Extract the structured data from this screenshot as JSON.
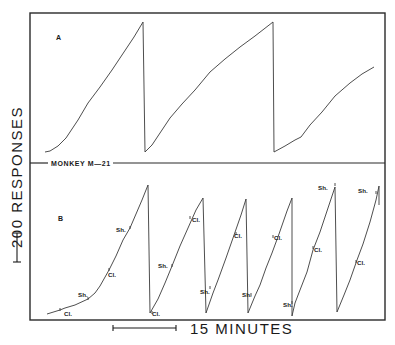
{
  "figure": {
    "ylabel": "200  RESPONSES",
    "xlabel": "15 MINUTES",
    "subject_label": "MONKEY M—21",
    "scalebars": {
      "vertical": {
        "represents": "200 responses"
      },
      "horizontal": {
        "represents": "15 minutes"
      }
    }
  },
  "chart_data": {
    "type": "line",
    "xlabel": "Time (scale bar = 15 minutes)",
    "ylabel": "Cumulative responses (scale bar = 200 responses, pen resets at top)",
    "grid": false,
    "legend": null,
    "panels": [
      {
        "label": "A",
        "description": "Cumulative record with pen resets; 3 excursions",
        "segments": [
          {
            "points": [
              [
                45,
                152
              ],
              [
                50,
                151
              ],
              [
                58,
                146
              ],
              [
                66,
                138
              ],
              [
                70,
                132
              ],
              [
                78,
                120
              ],
              [
                88,
                103
              ],
              [
                100,
                87
              ],
              [
                112,
                70
              ],
              [
                124,
                52
              ],
              [
                134,
                37
              ],
              [
                143,
                22
              ]
            ]
          },
          {
            "reset": [
              [
                143,
                22
              ],
              [
                145,
                152
              ]
            ]
          },
          {
            "points": [
              [
                145,
                152
              ],
              [
                152,
                145
              ],
              [
                160,
                133
              ],
              [
                170,
                118
              ],
              [
                182,
                104
              ],
              [
                195,
                90
              ],
              [
                210,
                72
              ],
              [
                225,
                59
              ],
              [
                240,
                47
              ],
              [
                255,
                36
              ],
              [
                273,
                22
              ]
            ]
          },
          {
            "reset": [
              [
                273,
                22
              ],
              [
                274,
                152
              ]
            ]
          },
          {
            "points": [
              [
                274,
                152
              ],
              [
                285,
                146
              ],
              [
                295,
                140
              ],
              [
                301,
                137
              ],
              [
                310,
                125
              ],
              [
                322,
                112
              ],
              [
                335,
                96
              ],
              [
                350,
                83
              ],
              [
                362,
                74
              ],
              [
                374,
                67
              ]
            ]
          }
        ]
      },
      {
        "label": "B",
        "description": "Cumulative record with Cl. / Sh. event marks; 6 excursions",
        "segments": [
          {
            "points": [
              [
                47,
                314
              ],
              [
                60,
                310
              ],
              [
                65,
                308
              ],
              [
                75,
                305
              ],
              [
                88,
                299
              ],
              [
                95,
                293
              ],
              [
                100,
                286
              ],
              [
                109,
                270
              ],
              [
                116,
                256
              ],
              [
                123,
                240
              ],
              [
                130,
                228
              ],
              [
                142,
                200
              ],
              [
                148,
                185
              ]
            ]
          },
          {
            "reset": [
              [
                148,
                185
              ],
              [
                150,
                313
              ]
            ]
          },
          {
            "points": [
              [
                150,
                313
              ],
              [
                158,
                299
              ],
              [
                165,
                283
              ],
              [
                172,
                266
              ],
              [
                180,
                246
              ],
              [
                188,
                228
              ],
              [
                196,
                210
              ],
              [
                203,
                198
              ]
            ]
          },
          {
            "reset": [
              [
                203,
                198
              ],
              [
                206,
                313
              ]
            ]
          },
          {
            "points": [
              [
                206,
                313
              ],
              [
                213,
                293
              ],
              [
                218,
                280
              ],
              [
                226,
                258
              ],
              [
                233,
                238
              ],
              [
                241,
                215
              ],
              [
                246,
                199
              ]
            ]
          },
          {
            "reset": [
              [
                246,
                199
              ],
              [
                248,
                313
              ]
            ]
          },
          {
            "points": [
              [
                248,
                313
              ],
              [
                255,
                296
              ],
              [
                260,
                285
              ],
              [
                266,
                268
              ],
              [
                272,
                253
              ],
              [
                279,
                234
              ],
              [
                287,
                211
              ],
              [
                292,
                198
              ]
            ]
          },
          {
            "reset": [
              [
                292,
                198
              ],
              [
                292,
                316
              ]
            ]
          },
          {
            "points": [
              [
                292,
                316
              ],
              [
                295,
                303
              ],
              [
                300,
                290
              ],
              [
                307,
                272
              ],
              [
                313,
                250
              ],
              [
                320,
                232
              ],
              [
                329,
                205
              ],
              [
                335,
                187
              ]
            ]
          },
          {
            "reset": [
              [
                335,
                187
              ],
              [
                337,
                312
              ]
            ]
          },
          {
            "points": [
              [
                337,
                312
              ],
              [
                344,
                295
              ],
              [
                350,
                280
              ],
              [
                357,
                260
              ],
              [
                363,
                244
              ],
              [
                370,
                222
              ],
              [
                376,
                200
              ],
              [
                379,
                186
              ]
            ]
          },
          {
            "reset": [
              [
                379,
                186
              ],
              [
                379,
                205
              ]
            ]
          }
        ],
        "event_marks": [
          {
            "text": "Cl.",
            "x": 60,
            "y": 310
          },
          {
            "text": "Sh.",
            "x": 88,
            "y": 299
          },
          {
            "text": "Cl.",
            "x": 109,
            "y": 270
          },
          {
            "text": "Sh.",
            "x": 130,
            "y": 228
          },
          {
            "text": "Cl.",
            "x": 152,
            "y": 313
          },
          {
            "text": "Sh.",
            "x": 172,
            "y": 266
          },
          {
            "text": "Cl.",
            "x": 190,
            "y": 218
          },
          {
            "text": "Sh.",
            "x": 210,
            "y": 288
          },
          {
            "text": "Cl.",
            "x": 236,
            "y": 234
          },
          {
            "text": "Sh.",
            "x": 251,
            "y": 295
          },
          {
            "text": "Cl.",
            "x": 273,
            "y": 237
          },
          {
            "text": "Sh.",
            "x": 292,
            "y": 303
          },
          {
            "text": "Cl.",
            "x": 313,
            "y": 248
          },
          {
            "text": "Sh.",
            "x": 335,
            "y": 185
          },
          {
            "text": "Cl.",
            "x": 356,
            "y": 262
          },
          {
            "text": "Sh.",
            "x": 376,
            "y": 193
          }
        ]
      }
    ]
  },
  "annotations": [
    {
      "text": "Cl.",
      "x": 64,
      "y": 316
    },
    {
      "text": "Sh.",
      "x": 78,
      "y": 297
    },
    {
      "text": "Cl.",
      "x": 108,
      "y": 277
    },
    {
      "text": "Sh.",
      "x": 116,
      "y": 232
    },
    {
      "text": "Cl.",
      "x": 152,
      "y": 316
    },
    {
      "text": "Sh.",
      "x": 158,
      "y": 268
    },
    {
      "text": "Cl.",
      "x": 192,
      "y": 222
    },
    {
      "text": "Sh.",
      "x": 200,
      "y": 294
    },
    {
      "text": "Cl.",
      "x": 234,
      "y": 238
    },
    {
      "text": "Sh.",
      "x": 242,
      "y": 297
    },
    {
      "text": "Cl.",
      "x": 274,
      "y": 240
    },
    {
      "text": "Sh.",
      "x": 283,
      "y": 307
    },
    {
      "text": "Cl.",
      "x": 314,
      "y": 252
    },
    {
      "text": "Sh.",
      "x": 318,
      "y": 190
    },
    {
      "text": "Cl.",
      "x": 357,
      "y": 265
    },
    {
      "text": "Sh.",
      "x": 358,
      "y": 193
    }
  ]
}
